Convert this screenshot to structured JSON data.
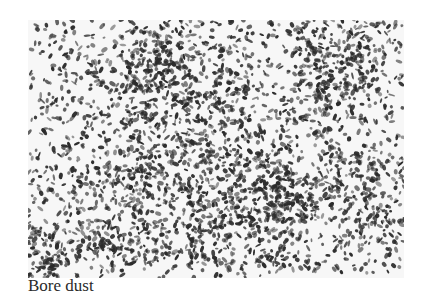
{
  "figure": {
    "caption": "Bore dust",
    "image": {
      "subject": "bore dust particles micrograph",
      "background_color": "#f7f7f7",
      "particle_color": "#2b2b2b",
      "particle_count": 3200,
      "seed": 7
    }
  }
}
